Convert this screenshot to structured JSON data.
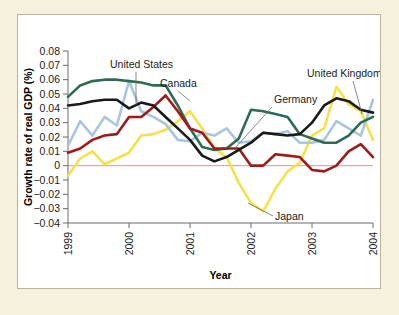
{
  "figure": {
    "background_color": "#f6f1dc",
    "panel_color": "#ffffff",
    "border_color": "#b9b49a"
  },
  "chart_data": {
    "type": "line",
    "title": "",
    "xlabel": "Year",
    "ylabel": "Growth rate of real GDP (%)",
    "xlim": [
      1999,
      2004
    ],
    "ylim": [
      -0.04,
      0.08
    ],
    "ytick_values": [
      0.08,
      0.07,
      0.06,
      0.05,
      0.04,
      0.03,
      0.02,
      0.01,
      0,
      -0.01,
      -0.02,
      -0.03,
      -0.04
    ],
    "ytick_labels": [
      "0.08",
      "0.07",
      "0.06",
      "0.05",
      "0.04",
      "0.03",
      "0.02",
      "0.01",
      "0",
      "−0.01",
      "−0.02",
      "−0.03",
      "−0.04"
    ],
    "xtick_values": [
      1999,
      2000,
      2001,
      2002,
      2003,
      2004
    ],
    "xtick_labels": [
      "1999",
      "2000",
      "2001",
      "2002",
      "2003",
      "2004"
    ],
    "grid": false,
    "legend_position": "inline-annotations",
    "zero_line": true,
    "series": [
      {
        "name": "Canada",
        "color": "#2f6b52",
        "x": [
          1999,
          1999.25,
          1999.5,
          1999.75,
          2000,
          2000.25,
          2000.5,
          2000.75,
          2001,
          2001.25,
          2001.5,
          2001.75,
          2002,
          2002.25,
          2002.5,
          2002.75,
          2003,
          2003.25,
          2003.5,
          2003.75,
          2004
        ],
        "values": [
          0.048,
          0.057,
          0.06,
          0.06,
          0.059,
          0.057,
          0.056,
          0.043,
          0.026,
          0.012,
          0.011,
          0.019,
          0.039,
          0.038,
          0.034,
          0.022,
          0.019,
          0.016,
          0.016,
          0.03,
          0.034
        ]
      },
      {
        "name": "United States",
        "color": "#1a1a1a",
        "x": [
          1999,
          1999.25,
          1999.5,
          1999.75,
          2000,
          2000.25,
          2000.5,
          2000.75,
          2001,
          2001.25,
          2001.5,
          2001.75,
          2002,
          2002.25,
          2002.5,
          2002.75,
          2003,
          2003.25,
          2003.5,
          2003.75,
          2004
        ],
        "values": [
          0.042,
          0.044,
          0.046,
          0.046,
          0.04,
          0.044,
          0.038,
          0.026,
          0.019,
          0.006,
          0.003,
          0.009,
          0.016,
          0.023,
          0.022,
          0.021,
          0.028,
          0.04,
          0.047,
          0.04,
          0.037
        ]
      },
      {
        "name": "United Kingdom",
        "color": "#a8c6e0",
        "x": [
          1999,
          1999.25,
          1999.5,
          1999.75,
          2000,
          2000.25,
          2000.5,
          2000.75,
          2001,
          2001.25,
          2001.5,
          2001.75,
          2002,
          2002.25,
          2002.5,
          2002.75,
          2003,
          2003.25,
          2003.5,
          2003.75,
          2004
        ],
        "values": [
          0.014,
          0.03,
          0.021,
          0.04,
          0.03,
          0.059,
          0.034,
          0.037,
          0.018,
          0.022,
          0.021,
          0.025,
          0.016,
          0.021,
          0.024,
          0.016,
          0.016,
          0.018,
          0.031,
          0.022,
          0.033
        ]
      },
      {
        "name": "Germany",
        "color": "#9e1b1b",
        "x": [
          1999,
          1999.25,
          1999.5,
          1999.75,
          2000,
          2000.25,
          2000.5,
          2000.75,
          2001,
          2001.25,
          2001.5,
          2001.75,
          2002,
          2002.25,
          2002.5,
          2002.75,
          2003,
          2003.25,
          2003.5,
          2003.75,
          2004
        ],
        "values": [
          0.009,
          0.012,
          0.018,
          0.021,
          0.022,
          0.034,
          0.034,
          0.041,
          0.049,
          0.027,
          0.024,
          0.013,
          0.012,
          0.012,
          0.0,
          0.0,
          0.002,
          0.008,
          0.007,
          0.004,
          0.006
        ]
      },
      {
        "name": "Japan",
        "color": "#f5e14b",
        "x": [
          1999,
          1999.25,
          1999.5,
          1999.75,
          2000,
          2000.25,
          2000.5,
          2000.75,
          2001,
          2001.25,
          2001.5,
          2001.75,
          2002,
          2002.25,
          2002.5,
          2002.75,
          2003,
          2003.25,
          2003.5,
          2003.75,
          2004
        ],
        "values": [
          -0.007,
          0.003,
          0.01,
          0.0,
          0.006,
          0.008,
          0.02,
          0.022,
          0.024,
          0.028,
          0.031,
          0.038,
          0.027,
          0.012,
          0.007,
          -0.01,
          -0.02,
          -0.032,
          -0.021,
          -0.002,
          0.005
        ]
      }
    ],
    "series_extended": {
      "Canada": {
        "x": [
          1999,
          1999.2,
          1999.4,
          1999.6,
          1999.8,
          2000,
          2000.2,
          2000.4,
          2000.6,
          2000.8,
          2001,
          2001.2,
          2001.4,
          2001.6,
          2001.8,
          2002,
          2002.2,
          2002.4,
          2002.6,
          2002.8,
          2003,
          2003.2,
          2003.4,
          2003.6,
          2003.8,
          2004
        ],
        "y": [
          0.048,
          0.056,
          0.059,
          0.06,
          0.06,
          0.059,
          0.058,
          0.056,
          0.056,
          0.042,
          0.026,
          0.013,
          0.011,
          0.012,
          0.019,
          0.039,
          0.038,
          0.036,
          0.034,
          0.022,
          0.019,
          0.016,
          0.016,
          0.021,
          0.03,
          0.034
        ]
      },
      "United States": {
        "x": [
          1999,
          1999.2,
          1999.4,
          1999.6,
          1999.8,
          2000,
          2000.2,
          2000.4,
          2000.6,
          2000.8,
          2001,
          2001.2,
          2001.4,
          2001.6,
          2001.8,
          2002,
          2002.2,
          2002.4,
          2002.6,
          2002.8,
          2003,
          2003.2,
          2003.4,
          2003.6,
          2003.8,
          2004
        ],
        "y": [
          0.042,
          0.043,
          0.045,
          0.046,
          0.046,
          0.04,
          0.044,
          0.042,
          0.034,
          0.026,
          0.018,
          0.007,
          0.003,
          0.006,
          0.011,
          0.016,
          0.023,
          0.022,
          0.021,
          0.022,
          0.03,
          0.042,
          0.047,
          0.045,
          0.039,
          0.037
        ]
      },
      "United Kingdom": {
        "x": [
          1999,
          1999.2,
          1999.4,
          1999.6,
          1999.8,
          2000,
          2000.2,
          2000.4,
          2000.6,
          2000.8,
          2001,
          2001.2,
          2001.4,
          2001.6,
          2001.8,
          2002,
          2002.2,
          2002.4,
          2002.6,
          2002.8,
          2003,
          2003.2,
          2003.4,
          2003.6,
          2003.8,
          2004
        ],
        "y": [
          0.014,
          0.031,
          0.021,
          0.034,
          0.028,
          0.059,
          0.038,
          0.034,
          0.029,
          0.018,
          0.017,
          0.023,
          0.021,
          0.026,
          0.016,
          0.017,
          0.023,
          0.022,
          0.024,
          0.016,
          0.016,
          0.018,
          0.031,
          0.026,
          0.021,
          0.046
        ]
      },
      "Germany": {
        "x": [
          1999,
          1999.2,
          1999.4,
          1999.6,
          1999.8,
          2000,
          2000.2,
          2000.4,
          2000.6,
          2000.8,
          2001,
          2001.2,
          2001.4,
          2001.6,
          2001.8,
          2002,
          2002.2,
          2002.4,
          2002.6,
          2002.8,
          2003,
          2003.2,
          2003.4,
          2003.6,
          2003.8,
          2004
        ],
        "y": [
          0.009,
          0.012,
          0.018,
          0.021,
          0.022,
          0.034,
          0.034,
          0.041,
          0.049,
          0.038,
          0.026,
          0.023,
          0.012,
          0.012,
          0.012,
          0.0,
          0.0,
          0.008,
          0.007,
          0.006,
          -0.003,
          -0.004,
          0.0,
          0.01,
          0.015,
          0.006
        ]
      },
      "Japan": {
        "x": [
          1999,
          1999.2,
          1999.4,
          1999.6,
          1999.8,
          2000,
          2000.2,
          2000.4,
          2000.6,
          2000.8,
          2001,
          2001.2,
          2001.4,
          2001.6,
          2001.8,
          2002,
          2002.2,
          2002.4,
          2002.6,
          2002.8,
          2003,
          2003.2,
          2003.4,
          2003.6,
          2003.8,
          2004
        ],
        "y": [
          -0.007,
          0.005,
          0.01,
          0.001,
          0.005,
          0.009,
          0.021,
          0.022,
          0.025,
          0.031,
          0.038,
          0.026,
          0.012,
          0.006,
          -0.012,
          -0.026,
          -0.032,
          -0.016,
          -0.004,
          0.002,
          0.021,
          0.026,
          0.055,
          0.043,
          0.038,
          0.018
        ]
      }
    },
    "annotations": [
      {
        "label": "United States",
        "text_x": 92,
        "text_y": 53,
        "anchor": "start",
        "leader": [
          118,
          57,
          118,
          90
        ]
      },
      {
        "label": "Canada",
        "text_x": 142,
        "text_y": 72,
        "anchor": "start",
        "leader": [
          160,
          76,
          172,
          86
        ]
      },
      {
        "label": "United Kingdom",
        "text_x": 289,
        "text_y": 62,
        "anchor": "start",
        "leader": [
          335,
          66,
          344,
          99
        ]
      },
      {
        "label": "Germany",
        "text_x": 256,
        "text_y": 88,
        "anchor": "start",
        "leader": [
          254,
          92,
          218,
          132
        ]
      },
      {
        "label": "Japan",
        "text_x": 257,
        "text_y": 205,
        "anchor": "start",
        "leader": [
          255,
          201,
          230,
          188
        ]
      }
    ]
  }
}
